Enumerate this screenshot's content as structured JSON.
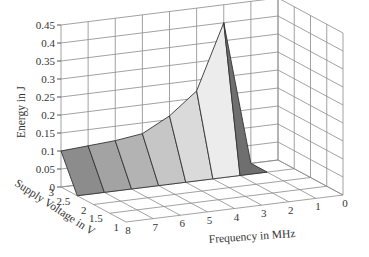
{
  "chart_data": {
    "type": "surface3d",
    "title": "",
    "xlabel": "Frequency in MHz",
    "ylabel": "Supply Voltage in V",
    "zlabel": "Energy in J",
    "x_ticks": [
      "8",
      "7",
      "6",
      "5",
      "4",
      "3",
      "2",
      "1",
      "0"
    ],
    "y_ticks": [
      "3",
      "2.5",
      "2",
      "1.5",
      "1"
    ],
    "z_ticks": [
      "0",
      "0.05",
      "0.1",
      "0.15",
      "0.2",
      "0.25",
      "0.3",
      "0.35",
      "0.4",
      "0.45"
    ],
    "zlim": [
      0,
      0.45
    ],
    "xlim": [
      8,
      0
    ],
    "ylim": [
      3,
      1
    ],
    "grid": true,
    "series": [
      {
        "name": "Energy at V=3",
        "frequency_mhz": [
          8,
          7,
          6,
          5,
          4,
          3,
          2,
          1
        ],
        "energy_j": [
          0.1,
          0.105,
          0.11,
          0.12,
          0.16,
          0.22,
          0.4,
          0.0
        ]
      },
      {
        "name": "Energy at V=2.5",
        "frequency_mhz": [
          8,
          7,
          6,
          5,
          4,
          3,
          2,
          1
        ],
        "energy_j": [
          0.0,
          0.0,
          0.0,
          0.0,
          0.0,
          0.0,
          0.0,
          0.0
        ]
      }
    ],
    "facet_shades": [
      "#8c8c8c",
      "#a3a3a3",
      "#b3b3b3",
      "#c6c6c6",
      "#dadada",
      "#ececec",
      "#6f6f6f"
    ]
  }
}
